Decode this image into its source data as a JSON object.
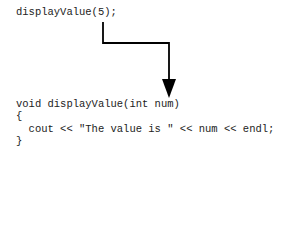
{
  "call_line": "displayValue(5);",
  "function_lines": [
    "void displayValue(int num)",
    "{",
    "  cout << \"The value is \" << num << endl;",
    "}"
  ],
  "arrow": {
    "from": "argument 5",
    "to": "parameter num",
    "color": "#000000"
  }
}
